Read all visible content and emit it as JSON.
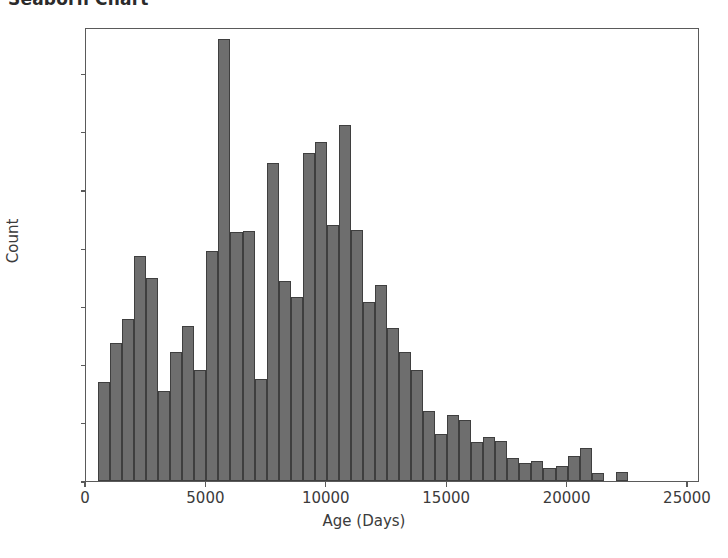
{
  "title": "Seaborn Chart",
  "chart_data": {
    "type": "bar",
    "subtype": "histogram",
    "title": "Seaborn Chart",
    "xlabel": "Age (Days)",
    "ylabel": "Count",
    "xlim": [
      0,
      25500
    ],
    "ylim": [
      0,
      780
    ],
    "xticks": [
      0,
      5000,
      10000,
      15000,
      20000,
      25000
    ],
    "xtick_labels": [
      "0",
      "5000",
      "10000",
      "15000",
      "20000",
      "25000"
    ],
    "yticks": [
      0,
      100,
      200,
      300,
      400,
      500,
      600,
      700
    ],
    "ytick_labels": [
      "0",
      "100",
      "200",
      "300",
      "400",
      "500",
      "600",
      "700"
    ],
    "grid": false,
    "legend": false,
    "bin_width": 500,
    "bar_color": "#6e6e6e",
    "bar_edge_color": "#3f3f3f",
    "bins": [
      {
        "x": 750,
        "value": 170
      },
      {
        "x": 1250,
        "value": 237
      },
      {
        "x": 1750,
        "value": 279
      },
      {
        "x": 2250,
        "value": 386
      },
      {
        "x": 2750,
        "value": 348
      },
      {
        "x": 3250,
        "value": 154
      },
      {
        "x": 3750,
        "value": 221
      },
      {
        "x": 4250,
        "value": 267
      },
      {
        "x": 4750,
        "value": 190
      },
      {
        "x": 5250,
        "value": 395
      },
      {
        "x": 5750,
        "value": 760
      },
      {
        "x": 6250,
        "value": 428
      },
      {
        "x": 6750,
        "value": 429
      },
      {
        "x": 7250,
        "value": 175
      },
      {
        "x": 7750,
        "value": 546
      },
      {
        "x": 8250,
        "value": 343
      },
      {
        "x": 8750,
        "value": 317
      },
      {
        "x": 9250,
        "value": 564
      },
      {
        "x": 9750,
        "value": 582
      },
      {
        "x": 10250,
        "value": 440
      },
      {
        "x": 10750,
        "value": 612
      },
      {
        "x": 11250,
        "value": 432
      },
      {
        "x": 11750,
        "value": 307
      },
      {
        "x": 12250,
        "value": 337
      },
      {
        "x": 12750,
        "value": 263
      },
      {
        "x": 13250,
        "value": 222
      },
      {
        "x": 13750,
        "value": 190
      },
      {
        "x": 14250,
        "value": 120
      },
      {
        "x": 14750,
        "value": 80
      },
      {
        "x": 15250,
        "value": 113
      },
      {
        "x": 15750,
        "value": 105
      },
      {
        "x": 16250,
        "value": 67
      },
      {
        "x": 16750,
        "value": 75
      },
      {
        "x": 17250,
        "value": 69
      },
      {
        "x": 17750,
        "value": 40
      },
      {
        "x": 18250,
        "value": 31
      },
      {
        "x": 18750,
        "value": 34
      },
      {
        "x": 19250,
        "value": 22
      },
      {
        "x": 19750,
        "value": 25
      },
      {
        "x": 20250,
        "value": 43
      },
      {
        "x": 20750,
        "value": 57
      },
      {
        "x": 21250,
        "value": 13
      },
      {
        "x": 22250,
        "value": 15
      },
      {
        "x": 26750,
        "value": 31
      }
    ]
  }
}
